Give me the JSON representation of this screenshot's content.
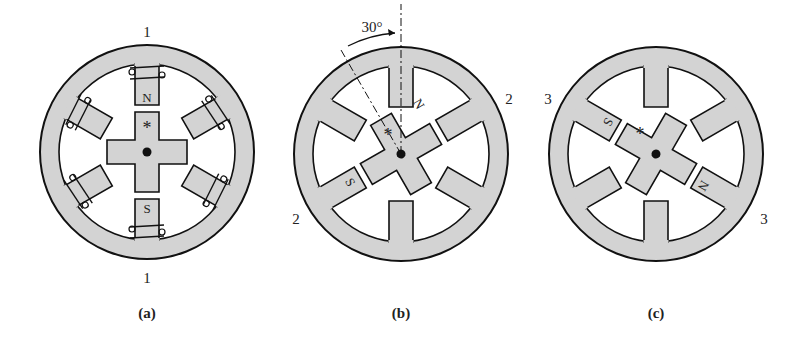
{
  "figure": {
    "colors": {
      "fill": "#d3d3d3",
      "stroke": "#111111",
      "background": "#ffffff"
    },
    "panels": [
      {
        "id": "a",
        "caption": "(a)",
        "phase_labels": [
          "1",
          "1"
        ],
        "rotor_pole_labels": {
          "north": "N",
          "south": "S"
        },
        "rotor_marker": "*",
        "rotor_angle_deg": 0
      },
      {
        "id": "b",
        "caption": "(b)",
        "phase_labels": [
          "2",
          "2"
        ],
        "rotor_pole_labels": {
          "north": "N",
          "south": "S"
        },
        "rotor_marker": "*",
        "rotor_angle_deg": -30,
        "angle_annotation": "30°"
      },
      {
        "id": "c",
        "caption": "(c)",
        "phase_labels": [
          "3",
          "3"
        ],
        "rotor_pole_labels": {
          "north": "N",
          "south": "S"
        },
        "rotor_marker": "*",
        "rotor_angle_deg": -60
      }
    ]
  }
}
